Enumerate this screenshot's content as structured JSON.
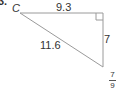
{
  "problem": {
    "number": "3."
  },
  "triangle": {
    "vertex_label": "C",
    "sides": {
      "top": "9.3",
      "hypotenuse": "11.6",
      "right": "7"
    },
    "right_angle_marker": true,
    "line_color": "#999999"
  },
  "answer": {
    "numerator": "7",
    "denominator": "9"
  }
}
